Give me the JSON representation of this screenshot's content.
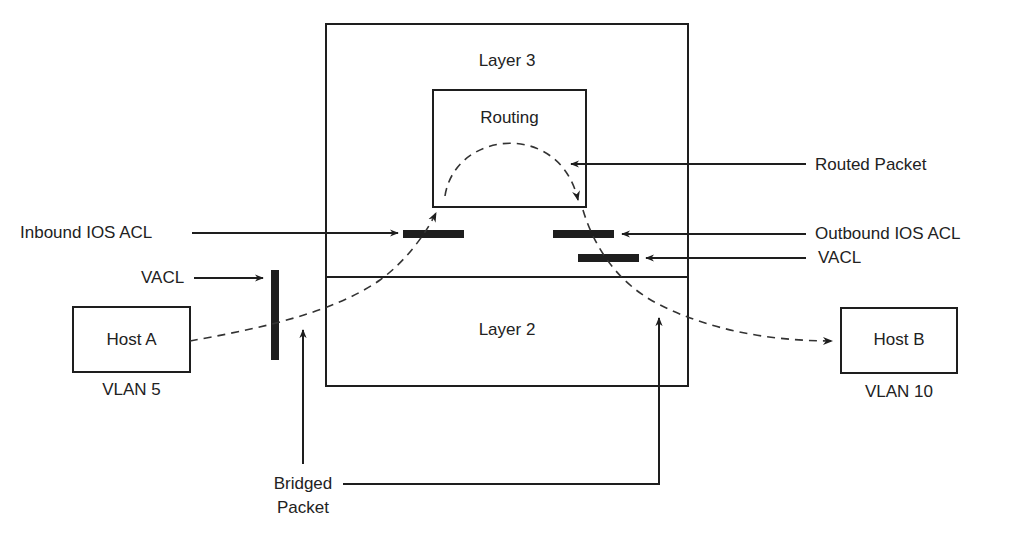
{
  "diagram": {
    "layers": {
      "layer3": "Layer 3",
      "routing": "Routing",
      "layer2": "Layer 2"
    },
    "hosts": {
      "host_a": {
        "label": "Host A",
        "vlan": "VLAN 5"
      },
      "host_b": {
        "label": "Host B",
        "vlan": "VLAN 10"
      }
    },
    "callouts": {
      "inbound_acl": "Inbound IOS ACL",
      "outbound_acl": "Outbound IOS ACL",
      "routed_packet": "Routed Packet",
      "vacl_left": "VACL",
      "vacl_right": "VACL",
      "bridged_packet_line1": "Bridged",
      "bridged_packet_line2": "Packet"
    },
    "colors": {
      "stroke": "#1e1e1e",
      "background": "#ffffff"
    }
  }
}
